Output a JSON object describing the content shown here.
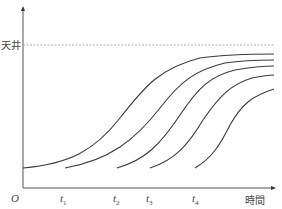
{
  "chart_data": {
    "type": "line",
    "title": "",
    "xlabel": "時間",
    "ylabel": "",
    "origin_label": "O",
    "ceiling_label": "天井",
    "x_ticks": [
      {
        "label": "t",
        "sub": "1",
        "x": 63
      },
      {
        "label": "t",
        "sub": "2",
        "x": 117
      },
      {
        "label": "t",
        "sub": "3",
        "x": 149
      },
      {
        "label": "t",
        "sub": "4",
        "x": 195
      }
    ],
    "series": [
      {
        "name": "curve-1",
        "start": "O",
        "path": "M23,168 C70,164 95,150 120,118 C145,86 160,68 200,58 C230,54 255,54 274,54"
      },
      {
        "name": "curve-2",
        "start": "t1",
        "path": "M65,168 C110,160 135,140 160,108 C180,82 195,70 225,63 C245,60 260,60 274,60"
      },
      {
        "name": "curve-3",
        "start": "t2",
        "path": "M117,168 C145,160 160,145 180,115 C198,88 210,76 235,70 C252,67 262,66 274,66"
      },
      {
        "name": "curve-4",
        "start": "t3",
        "path": "M150,168 C175,160 188,145 203,120 C220,95 232,84 252,78 C262,76 268,75 274,75"
      },
      {
        "name": "curve-5",
        "start": "t4",
        "path": "M195,168 C212,158 220,145 230,125 C242,104 252,96 274,89"
      }
    ],
    "ceiling_y": 45,
    "grid": false,
    "legend": "none"
  },
  "colors": {
    "curve": "#3a3a3a",
    "axis": "#555555",
    "ceiling": "#9a9a9a"
  }
}
